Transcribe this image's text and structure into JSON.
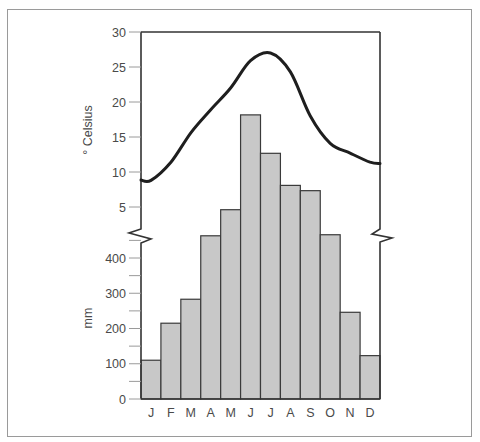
{
  "chart_data": {
    "type": "bar+line",
    "title": "",
    "categories": [
      "J",
      "F",
      "M",
      "A",
      "M",
      "J",
      "J",
      "A",
      "S",
      "O",
      "N",
      "D"
    ],
    "series": [
      {
        "name": "Precipitation",
        "type": "bar",
        "unit": "mm",
        "values": [
          110,
          215,
          283,
          463,
          537,
          806,
          697,
          606,
          591,
          466,
          246,
          123
        ]
      },
      {
        "name": "Temperature",
        "type": "line",
        "unit": "° Celsius",
        "values": [
          8.8,
          11.4,
          15.6,
          18.9,
          22.0,
          25.9,
          27.0,
          24.3,
          18.0,
          14.1,
          12.7,
          11.4
        ]
      }
    ],
    "axes": {
      "temperature": {
        "label": "° Celsius",
        "ticks": [
          "5",
          "10",
          "15",
          "20",
          "25",
          "30"
        ],
        "range": [
          3,
          30
        ]
      },
      "precipitation": {
        "label": "mm",
        "ticks": [
          "0",
          "100",
          "200",
          "300",
          "400"
        ],
        "minor_tick_step": 50,
        "range": [
          0,
          450
        ]
      }
    },
    "axis_break": true,
    "grid": false,
    "legend": "none",
    "colors": {
      "bar_fill": "#c8c8c8",
      "bar_stroke": "#3a3a3a",
      "line": "#1e1e1e",
      "axis": "#333333",
      "frame": "#9a9a9a",
      "text": "#4a4a4a"
    }
  }
}
